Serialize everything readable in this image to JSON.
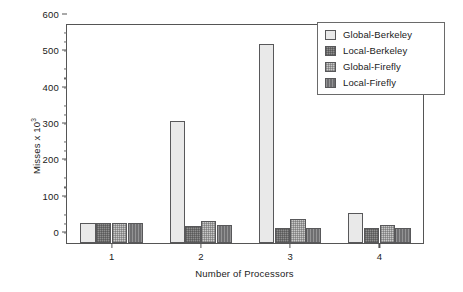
{
  "chart_data": {
    "type": "bar",
    "title": "",
    "xlabel": "Number of Processors",
    "ylabel": "Misses x 10",
    "ylabel_exponent": "3",
    "categories": [
      "1",
      "2",
      "3",
      "4"
    ],
    "ylim": [
      0,
      600
    ],
    "yticks": [
      0,
      100,
      200,
      300,
      400,
      500,
      600
    ],
    "ytick_labels": [
      "0",
      "100",
      "200",
      "300",
      "400",
      "500",
      "600"
    ],
    "y_minor_interval": 25,
    "grid": false,
    "legend_position": "top-right",
    "series": [
      {
        "name": "Global-Berkeley",
        "values": [
          55,
          333,
          545,
          82
        ],
        "color": "#e9e9e9"
      },
      {
        "name": "Local-Berkeley",
        "values": [
          55,
          47,
          40,
          40
        ],
        "color": "#8f8f8f"
      },
      {
        "name": "Global-Firefly",
        "values": [
          55,
          60,
          65,
          48
        ],
        "color": "#c9c9c9"
      },
      {
        "name": "Local-Firefly",
        "values": [
          55,
          50,
          42,
          41
        ],
        "color": "#6e6e70"
      }
    ]
  },
  "legend": {
    "items": [
      {
        "label": "Global-Berkeley"
      },
      {
        "label": "Local-Berkeley"
      },
      {
        "label": "Global-Firefly"
      },
      {
        "label": "Local-Firefly"
      }
    ]
  }
}
